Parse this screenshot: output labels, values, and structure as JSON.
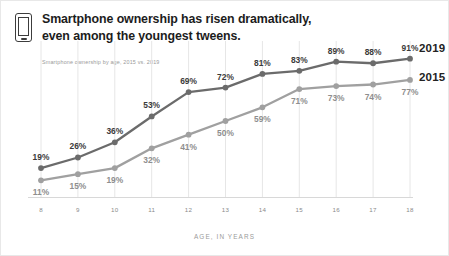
{
  "header": {
    "icon": "smartphone-icon",
    "title": "Smartphone ownership has risen dramatically,\neven among the youngest tweens.",
    "subtitle": "Smartphone ownership by age, 2015 vs. 2019"
  },
  "legend": {
    "series_2019_label": "2019",
    "series_2015_label": "2015"
  },
  "colors": {
    "series_2019": "#6b6b6b",
    "series_2015": "#a0a0a0",
    "gridline": "#e6e6e6",
    "title_text": "#1c1c1c",
    "subtitle_text": "#9a9a9a",
    "axis_text": "#8a8a8a"
  },
  "chart_data": {
    "type": "line",
    "title": "Smartphone ownership has risen dramatically, even among the youngest tweens.",
    "subtitle": "Smartphone ownership by age, 2015 vs. 2019",
    "xlabel": "AGE, IN YEARS",
    "ylabel": "",
    "categories": [
      "8",
      "9",
      "10",
      "11",
      "12",
      "13",
      "14",
      "15",
      "16",
      "17",
      "18"
    ],
    "x": [
      8,
      9,
      10,
      11,
      12,
      13,
      14,
      15,
      16,
      17,
      18
    ],
    "xlim": [
      8,
      18
    ],
    "ylim": [
      0,
      100
    ],
    "grid": "vertical",
    "legend_position": "right",
    "series": [
      {
        "name": "2019",
        "color": "#6b6b6b",
        "label_position": "above",
        "values": [
          19,
          26,
          36,
          53,
          69,
          72,
          81,
          83,
          89,
          88,
          91
        ],
        "labels": [
          "19%",
          "26%",
          "36%",
          "53%",
          "69%",
          "72%",
          "81%",
          "83%",
          "89%",
          "88%",
          "91%"
        ]
      },
      {
        "name": "2015",
        "color": "#a0a0a0",
        "label_position": "below",
        "values": [
          11,
          15,
          19,
          32,
          41,
          50,
          59,
          71,
          73,
          74,
          77
        ],
        "labels": [
          "11%",
          "15%",
          "19%",
          "32%",
          "41%",
          "50%",
          "59%",
          "71%",
          "73%",
          "74%",
          "77%"
        ]
      }
    ]
  }
}
